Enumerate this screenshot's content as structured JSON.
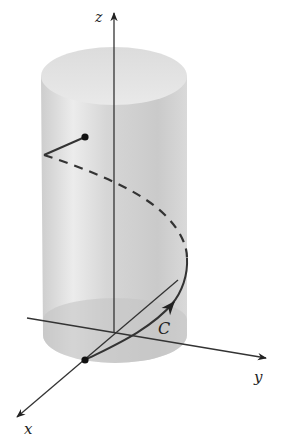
{
  "figure": {
    "axes": {
      "z_label": "z",
      "y_label": "y",
      "x_label": "x"
    },
    "curve_label": "C",
    "colors": {
      "cylinder_light": "#e6e6e6",
      "cylinder_mid": "#cfcfcf",
      "cylinder_dark": "#bdbdbd",
      "ink": "#333333"
    }
  }
}
